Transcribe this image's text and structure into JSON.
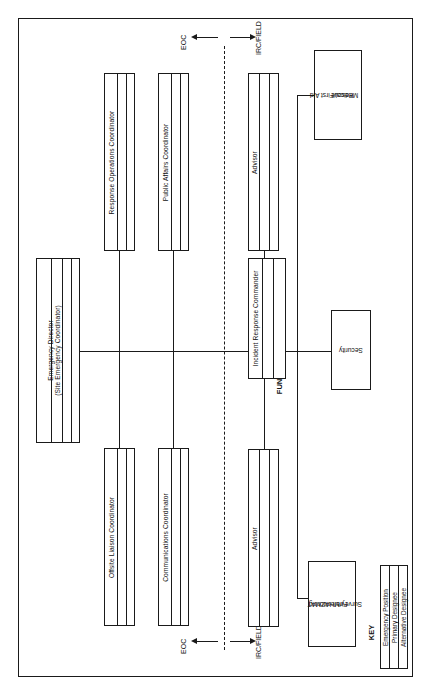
{
  "figure": {
    "orientation": "rotated-90-ccw",
    "frame_color": "#1a1a1a",
    "background": "#ffffff"
  },
  "zones": {
    "left_label": "EOC",
    "right_label": "IRC/FIELD",
    "divider_style": "dashed"
  },
  "positions": {
    "director": {
      "line1": "Emergency  Director",
      "line2": "(Site Emergency Coordinator)",
      "strips": 4
    },
    "response_operations": {
      "label": "Response Operations Coordinator",
      "strips": 3
    },
    "public_affairs": {
      "label": "Public Affairs Coordinator",
      "strips": 3
    },
    "offsite_liaison": {
      "label": "Offsite Liaison Coordinator",
      "strips": 3
    },
    "communications": {
      "label": "Communications Coordinator",
      "strips": 3
    },
    "advisor_top": {
      "label": "Advisor",
      "strips": 3
    },
    "advisor_bottom": {
      "label": "Advisor",
      "strips": 3
    },
    "incident_commander": {
      "label": "Incident Response Commander",
      "strips": 3
    }
  },
  "section_captions": {
    "function": "FUNCTION",
    "teams": "TEAMS"
  },
  "teams": [
    {
      "id": "medical",
      "label": "Medical/First Aid\nRescue",
      "line1": "Medical/First Aid",
      "line2": "Rescue"
    },
    {
      "id": "security",
      "label": "Security",
      "line1": "Security",
      "line2": ""
    },
    {
      "id": "fire-hazmat",
      "label": "Fire/HAZMAT\nSurvey/Monitoring",
      "line1": "Fire/HAZMAT",
      "line2": "Survey/Monitoring"
    }
  ],
  "key": {
    "title": "KEY",
    "rows": [
      "Emergency Position",
      "Primary Designee",
      "Alternative Designee"
    ]
  }
}
